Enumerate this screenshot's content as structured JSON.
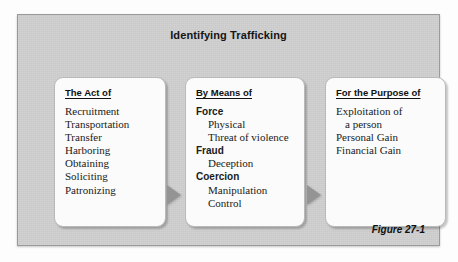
{
  "figure": {
    "title": "Identifying Trafficking",
    "caption": "Figure 27-1",
    "colors": {
      "panel_background": "#cfcfcf",
      "panel_border": "#9a9a9a",
      "card_background": "#fbfbfb",
      "card_border": "#b9b9b9",
      "arrow": "#949494",
      "text": "#1a1a1a"
    }
  },
  "boxes": [
    {
      "heading": "The Act of",
      "items": [
        {
          "text": "Recruitment",
          "style": "plain"
        },
        {
          "text": "Transportation",
          "style": "plain"
        },
        {
          "text": "Transfer",
          "style": "plain"
        },
        {
          "text": "Harboring",
          "style": "plain"
        },
        {
          "text": "Obtaining",
          "style": "plain"
        },
        {
          "text": "Soliciting",
          "style": "plain"
        },
        {
          "text": "Patronizing",
          "style": "plain"
        }
      ]
    },
    {
      "heading": "By Means of",
      "items": [
        {
          "text": "Force",
          "style": "bold"
        },
        {
          "text": "Physical",
          "style": "indent"
        },
        {
          "text": "Threat of violence",
          "style": "indent"
        },
        {
          "text": "Fraud",
          "style": "bold"
        },
        {
          "text": "Deception",
          "style": "indent"
        },
        {
          "text": "Coercion",
          "style": "bold"
        },
        {
          "text": "Manipulation",
          "style": "indent"
        },
        {
          "text": "Control",
          "style": "indent"
        }
      ]
    },
    {
      "heading": "For the Purpose of",
      "items": [
        {
          "text": "Exploitation of",
          "style": "plain"
        },
        {
          "text": "a person",
          "style": "indent-s"
        },
        {
          "text": "Personal Gain",
          "style": "plain"
        },
        {
          "text": "Financial Gain",
          "style": "plain"
        }
      ]
    }
  ],
  "arrows": [
    {
      "name": "arrow-act-to-means",
      "direction": "right"
    },
    {
      "name": "arrow-means-to-purpose",
      "direction": "right"
    }
  ]
}
